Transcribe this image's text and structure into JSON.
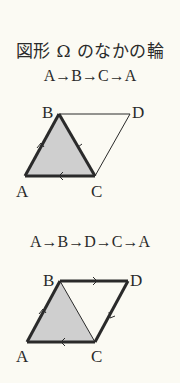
{
  "title": "図形 Ω のなかの輪",
  "diagrams": [
    {
      "sequence": "A→B→C→A",
      "labels": {
        "A": "A",
        "B": "B",
        "C": "C",
        "D": "D"
      },
      "shaded": "triangle ABC",
      "bold_edges": [
        "AB",
        "BC",
        "CA"
      ]
    },
    {
      "sequence": "A→B→D→C→A",
      "labels": {
        "A": "A",
        "B": "B",
        "C": "C",
        "D": "D"
      },
      "shaded": "triangle ABC",
      "bold_edges": [
        "AB",
        "BD",
        "DC",
        "CA"
      ]
    }
  ],
  "colors": {
    "background": "#fbfaf3",
    "shade": "#cfcfcf",
    "line": "#2a2a2a"
  }
}
